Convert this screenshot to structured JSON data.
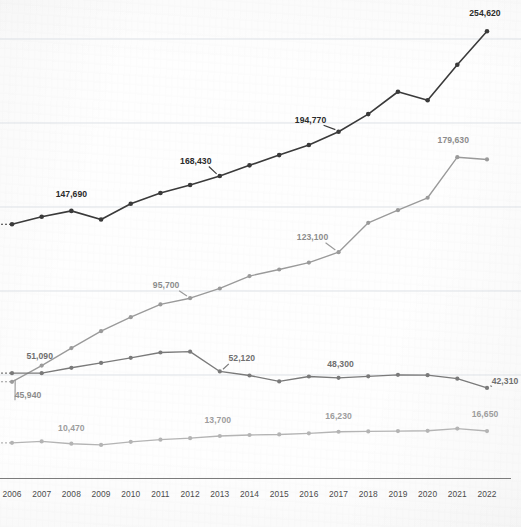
{
  "chart_data": {
    "type": "line",
    "title": "",
    "subtitle": "",
    "xlabel": "",
    "ylabel": "",
    "grid": true,
    "legend_position": "none",
    "x": [
      2006,
      2007,
      2008,
      2009,
      2010,
      2011,
      2012,
      2013,
      2014,
      2015,
      2016,
      2017,
      2018,
      2019,
      2020,
      2021,
      2022
    ],
    "categories": [
      "2006",
      "2007",
      "2008",
      "2009",
      "2010",
      "2011",
      "2012",
      "2013",
      "2014",
      "2015",
      "2016",
      "2017",
      "2018",
      "2019",
      "2020",
      "2021",
      "2022"
    ],
    "ylim": [
      0,
      274000
    ],
    "gridline_values": [
      50000,
      100000,
      150000,
      200000,
      250000
    ],
    "series": [
      {
        "name": "series-dark",
        "color": "#3a3a3a",
        "values": [
          139700,
          144200,
          147690,
          142600,
          151900,
          158300,
          163100,
          168430,
          174800,
          180900,
          186900,
          194770,
          205300,
          218600,
          213500,
          234700,
          254620
        ],
        "labels": [
          {
            "year": 2008,
            "text": "147,690"
          },
          {
            "year": 2013,
            "text": "168,430"
          },
          {
            "year": 2017,
            "text": "194,770"
          },
          {
            "year": 2022,
            "text": "254,620"
          }
        ]
      },
      {
        "name": "series-mid-rising",
        "color": "#9a9a9a",
        "values": [
          45940,
          55600,
          66000,
          76100,
          84400,
          92000,
          95700,
          101500,
          108900,
          112800,
          116900,
          123100,
          140600,
          148100,
          155500,
          179630,
          178300
        ],
        "labels": [
          {
            "year": 2006,
            "text": "45,940"
          },
          {
            "year": 2012,
            "text": "95,700"
          },
          {
            "year": 2017,
            "text": "123,100"
          },
          {
            "year": 2021,
            "text": "179,630"
          }
        ]
      },
      {
        "name": "series-flat",
        "color": "#7a7a7a",
        "values": [
          51090,
          51090,
          54300,
          57200,
          60200,
          63400,
          63900,
          52120,
          49700,
          46200,
          49100,
          48300,
          49200,
          50100,
          49900,
          47800,
          42310
        ],
        "labels": [
          {
            "year": 2007,
            "text": "51,090"
          },
          {
            "year": 2013,
            "text": "52,120"
          },
          {
            "year": 2017,
            "text": "48,300"
          },
          {
            "year": 2022,
            "text": "42,310"
          }
        ]
      },
      {
        "name": "series-bottom",
        "color": "#b4b4b4",
        "values": [
          9600,
          10470,
          9100,
          8400,
          10200,
          11500,
          12400,
          13700,
          14300,
          14600,
          15300,
          16230,
          16400,
          16600,
          16800,
          18100,
          16650
        ],
        "labels": [
          {
            "year": 2008,
            "text": "10,470"
          },
          {
            "year": 2013,
            "text": "13,700"
          },
          {
            "year": 2017,
            "text": "16,230"
          },
          {
            "year": 2022,
            "text": "16,650"
          }
        ]
      }
    ]
  },
  "axis": {
    "x_tick_labels": [
      "2006",
      "2007",
      "2008",
      "2009",
      "2010",
      "2011",
      "2012",
      "2013",
      "2014",
      "2015",
      "2016",
      "2017",
      "2018",
      "2019",
      "2020",
      "2021",
      "2022"
    ]
  },
  "colors": {
    "dark": "#3a3a3a",
    "mid_rising": "#9a9a9a",
    "flat": "#7a7a7a",
    "bottom": "#b4b4b4",
    "grid": "#d8dde3",
    "axis": "#6d6d6d",
    "background": "#fefefe"
  }
}
